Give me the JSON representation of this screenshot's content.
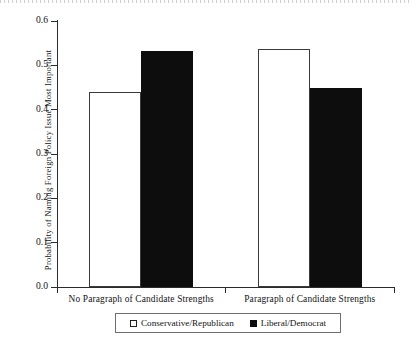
{
  "chart_data": {
    "type": "bar",
    "title": "",
    "xlabel": "",
    "ylabel": "Probability of Naming Foreign Policy  Issue Most Important",
    "ylim": [
      0.0,
      0.6
    ],
    "ytick_labels": [
      "0.6",
      "0.5",
      "0.4",
      "0.3",
      "0.2",
      "0.1",
      "0.0"
    ],
    "ytick_values": [
      0.6,
      0.5,
      0.4,
      0.3,
      0.2,
      0.1,
      0.0
    ],
    "grid": false,
    "legend_position": "bottom",
    "categories": [
      "No Paragraph of Candidate Strengths",
      "Paragraph of Candidate Strengths"
    ],
    "series": [
      {
        "name": "Conservative/Republican",
        "style": "open",
        "color": "#ffffff",
        "edge_color": "#3a3a3a",
        "values": [
          0.44,
          0.537
        ]
      },
      {
        "name": "Liberal/Democrat",
        "style": "filled",
        "color": "#0d0d0d",
        "edge_color": "#0d0d0d",
        "values": [
          0.533,
          0.45
        ]
      }
    ]
  },
  "axis": {
    "y_label": "Probability of Naming Foreign Policy  Issue Most Important",
    "ticks": [
      {
        "label": "0.6",
        "value": 0.6
      },
      {
        "label": "0.5",
        "value": 0.5
      },
      {
        "label": "0.4",
        "value": 0.4
      },
      {
        "label": "0.3",
        "value": 0.3
      },
      {
        "label": "0.2",
        "value": 0.2
      },
      {
        "label": "0.1",
        "value": 0.1
      },
      {
        "label": "0.0",
        "value": 0.0
      }
    ]
  },
  "categories": [
    {
      "label": "No Paragraph of Candidate Strengths"
    },
    {
      "label": "Paragraph of Candidate Strengths"
    }
  ],
  "legend": {
    "entries": [
      {
        "label": "Conservative/Republican",
        "style": "open"
      },
      {
        "label": "Liberal/Democrat",
        "style": "filled"
      }
    ]
  }
}
